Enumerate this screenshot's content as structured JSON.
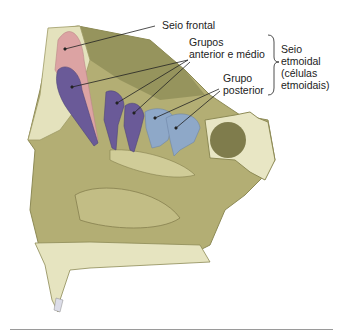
{
  "figure": {
    "colors": {
      "bone": "#b9b47c",
      "bone_dark": "#8d8a55",
      "bone_light": "#e8e6c4",
      "frontal_sinus": "#dca3a3",
      "anterior_middle": "#6a5a98",
      "posterior": "#8ea8c8"
    }
  },
  "labels": {
    "frontal": "Seio frontal",
    "ant_mid_1": "Grupos",
    "ant_mid_2": "anterior e médio",
    "post_1": "Grupo",
    "post_2": "posterior",
    "ethmoid_1": "Seio",
    "ethmoid_2": "etmoidal",
    "ethmoid_3": "(células",
    "ethmoid_4": "etmoidais)"
  }
}
